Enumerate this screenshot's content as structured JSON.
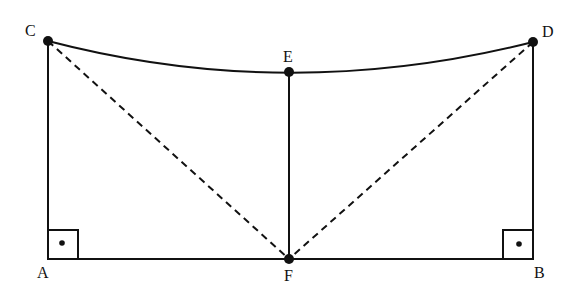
{
  "diagram": {
    "type": "geometry",
    "points": {
      "A": {
        "label": "A",
        "x": 48,
        "y": 259
      },
      "B": {
        "label": "B",
        "x": 533,
        "y": 259
      },
      "C": {
        "label": "C",
        "x": 48,
        "y": 41
      },
      "D": {
        "label": "D",
        "x": 533,
        "y": 42
      },
      "E": {
        "label": "E",
        "x": 289,
        "y": 72
      },
      "F": {
        "label": "F",
        "x": 289,
        "y": 259
      }
    },
    "segments": [
      {
        "from": "A",
        "to": "B",
        "style": "solid"
      },
      {
        "from": "A",
        "to": "C",
        "style": "solid"
      },
      {
        "from": "B",
        "to": "D",
        "style": "solid"
      },
      {
        "from": "E",
        "to": "F",
        "style": "solid"
      },
      {
        "from": "C",
        "to": "F",
        "style": "dashed"
      },
      {
        "from": "D",
        "to": "F",
        "style": "dashed"
      }
    ],
    "curves": [
      {
        "through": [
          "C",
          "E",
          "D"
        ],
        "style": "solid",
        "shape": "sagging-arc"
      }
    ],
    "right_angles": [
      "A",
      "B"
    ],
    "dots": [
      "C",
      "D",
      "E",
      "F"
    ],
    "colors": {
      "stroke": "#111111",
      "background": "#ffffff"
    }
  }
}
